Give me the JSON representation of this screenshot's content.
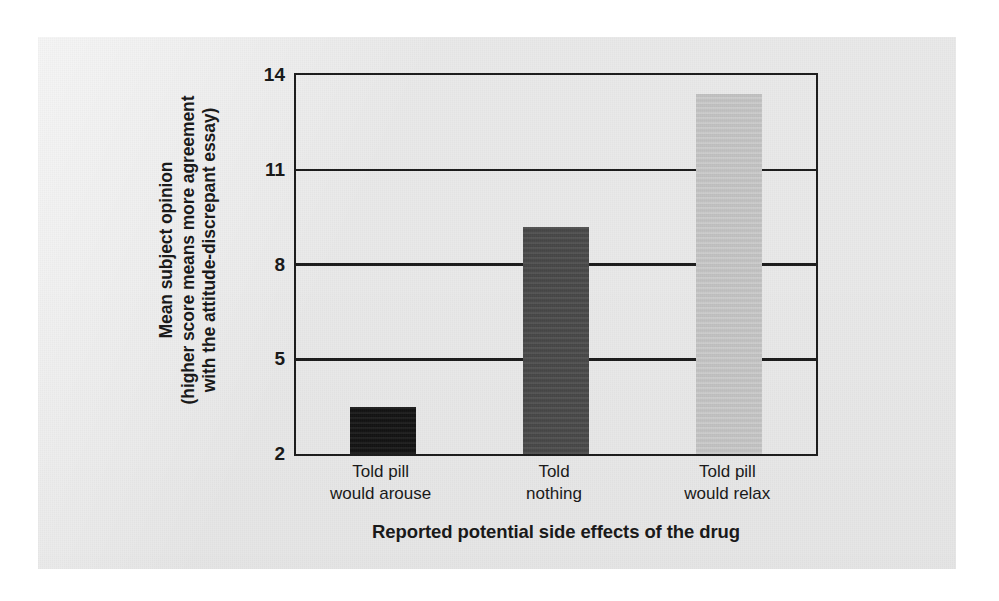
{
  "figure": {
    "background_color": "#e9e9e9",
    "page_color": "#ffffff",
    "axis_color": "#1b1b1b"
  },
  "chart_data": {
    "type": "bar",
    "title": "",
    "categories": [
      "Told pill would arouse",
      "Told nothing",
      "Told pill would relax"
    ],
    "category_lines": [
      [
        "Told pill",
        "would arouse"
      ],
      [
        "Told",
        "nothing"
      ],
      [
        "Told pill",
        "would relax"
      ]
    ],
    "values": [
      3.5,
      9.2,
      13.4
    ],
    "bar_colors": [
      "#131313",
      "#4a4a4a",
      "#c8c8c8"
    ],
    "xlabel": "Reported potential side effects of the drug",
    "ylabel_lines": [
      "Mean subject opinion",
      "(higher score means more agreement",
      "with the attitude-discrepant essay)"
    ],
    "ylim": [
      2,
      14
    ],
    "yticks": [
      2,
      5,
      8,
      11,
      14
    ],
    "ytick_labels": [
      "2",
      "5",
      "8",
      "11",
      "14"
    ],
    "grid": true,
    "grid_axis": "y",
    "legend": null,
    "legend_position": "none"
  }
}
